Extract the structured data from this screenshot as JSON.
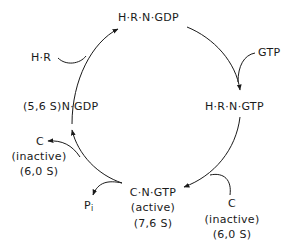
{
  "diagram": {
    "type": "cycle",
    "nodes": {
      "top": "H·R·N·GDP",
      "right": "H·R·N·GTP",
      "bottom": {
        "name": "C·N·GTP",
        "state": "(active)",
        "sedimentation": "(7,6 S)"
      },
      "left": "(5,6 S)N·GDP"
    },
    "inputs_outputs": {
      "hr_in": "H·R",
      "gtp_in": "GTP",
      "c_in": {
        "name": "C",
        "state": "(inactive)",
        "sedimentation": "(6,0 S)"
      },
      "pi_out": {
        "base": "P",
        "sub": "i"
      },
      "c_out": {
        "name": "C",
        "state": "(inactive)",
        "sedimentation": "(6,0 S)"
      }
    },
    "line_color": "#1a1a1a"
  }
}
